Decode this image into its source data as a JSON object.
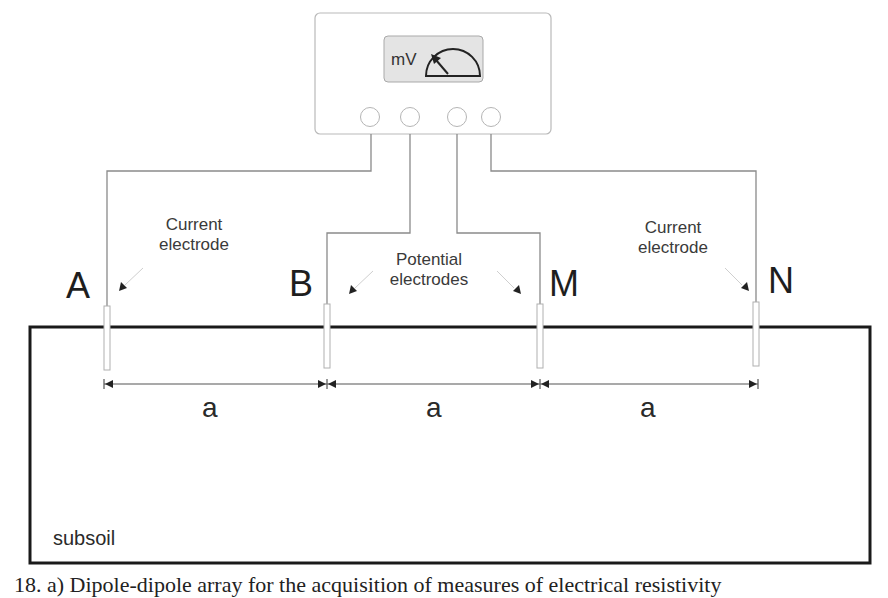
{
  "diagram": {
    "meter": {
      "unit_label": "mV",
      "terminals": 4,
      "icon": "analog-gauge-icon"
    },
    "electrodes": [
      {
        "id": "A",
        "label": "A",
        "role": "Current electrode"
      },
      {
        "id": "B",
        "label": "B",
        "role": "Potential electrode"
      },
      {
        "id": "M",
        "label": "M",
        "role": "Potential electrode"
      },
      {
        "id": "N",
        "label": "N",
        "role": "Current electrode"
      }
    ],
    "annotations": {
      "left_current": [
        "Current",
        "electrode"
      ],
      "potential": [
        "Potential",
        "electrodes"
      ],
      "right_current": [
        "Current",
        "electrode"
      ]
    },
    "spacings": [
      "a",
      "a",
      "a"
    ],
    "ground_label": "subsoil",
    "caption": "18. a) Dipole-dipole array for the acquisition of measures of electrical resistivity"
  }
}
